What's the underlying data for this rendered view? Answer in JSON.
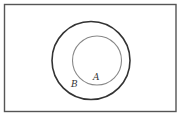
{
  "diagram": {
    "type": "venn",
    "universe": {
      "x": 4.5,
      "y": 4.5,
      "width": 171.5,
      "height": 107,
      "stroke": "#555555"
    },
    "sets": [
      {
        "name": "B",
        "label": "B",
        "cx": 91,
        "cy": 60.5,
        "r": 39,
        "stroke": "#333333",
        "stroke_width": 1.6,
        "label_x": 71,
        "label_y": 87
      },
      {
        "name": "A",
        "label": "A",
        "cx": 97,
        "cy": 60.5,
        "r": 24.5,
        "stroke": "#888888",
        "stroke_width": 1.1,
        "label_x": 93,
        "label_y": 80
      }
    ],
    "relation": "A is a subset of B"
  }
}
